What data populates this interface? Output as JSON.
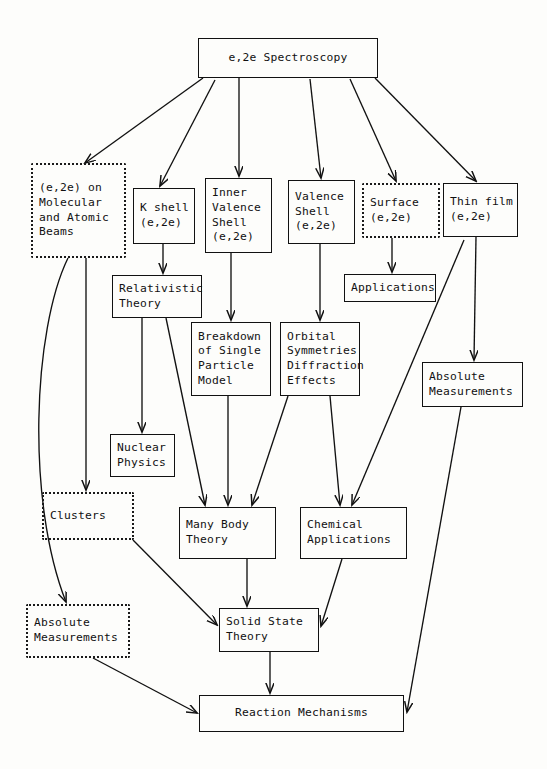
{
  "diagram": {
    "title": "e,2e Spectroscopy",
    "type": "flowchart",
    "nodes": [
      {
        "id": "root",
        "label": "e,2e Spectroscopy",
        "lines": [
          "e,2e Spectroscopy"
        ],
        "style": "solid",
        "x": 198,
        "y": 38,
        "w": 180,
        "h": 40
      },
      {
        "id": "molecular",
        "label": "(e,2e) on Molecular and Atomic Beams",
        "lines": [
          "(e,2e) on",
          "Molecular",
          "and Atomic",
          "Beams"
        ],
        "style": "dashed",
        "x": 31,
        "y": 163,
        "w": 95,
        "h": 95
      },
      {
        "id": "kshell",
        "label": "K shell (e,2e)",
        "lines": [
          "K shell",
          "(e,2e)"
        ],
        "style": "solid",
        "x": 133,
        "y": 188,
        "w": 62,
        "h": 56
      },
      {
        "id": "innervalence",
        "label": "Inner Valence Shell (e,2e)",
        "lines": [
          "Inner",
          "Valence",
          "Shell",
          "(e,2e)"
        ],
        "style": "solid",
        "x": 205,
        "y": 178,
        "w": 67,
        "h": 75
      },
      {
        "id": "valence",
        "label": "Valence Shell (e,2e)",
        "lines": [
          "Valence",
          "Shell",
          "(e,2e)"
        ],
        "style": "solid",
        "x": 288,
        "y": 180,
        "w": 67,
        "h": 64
      },
      {
        "id": "surface",
        "label": "Surface (e,2e)",
        "lines": [
          "Surface",
          "(e,2e)"
        ],
        "style": "dashed",
        "x": 362,
        "y": 183,
        "w": 78,
        "h": 55
      },
      {
        "id": "thinfilm",
        "label": "Thin film (e,2e)",
        "lines": [
          "Thin film",
          "(e,2e)"
        ],
        "style": "solid",
        "x": 443,
        "y": 183,
        "w": 75,
        "h": 54
      },
      {
        "id": "relativistic",
        "label": "Relativistic Theory",
        "lines": [
          "Relativistic",
          "Theory"
        ],
        "style": "solid",
        "x": 112,
        "y": 275,
        "w": 90,
        "h": 43
      },
      {
        "id": "breakdown",
        "label": "Breakdown of Single Particle Model",
        "lines": [
          "Breakdown",
          "of Single",
          "Particle",
          "Model"
        ],
        "style": "solid",
        "x": 191,
        "y": 322,
        "w": 80,
        "h": 74
      },
      {
        "id": "orbital",
        "label": "Orbital Symmetries Diffraction Effects",
        "lines": [
          "Orbital",
          "Symmetries",
          "Diffraction",
          "Effects"
        ],
        "style": "solid",
        "x": 280,
        "y": 322,
        "w": 80,
        "h": 74
      },
      {
        "id": "applications",
        "label": "Applications",
        "lines": [
          "Applications"
        ],
        "style": "solid",
        "x": 344,
        "y": 274,
        "w": 92,
        "h": 28
      },
      {
        "id": "absmeas_r",
        "label": "Absolute Measurements",
        "lines": [
          "Absolute",
          "Measurements"
        ],
        "style": "solid",
        "x": 422,
        "y": 362,
        "w": 101,
        "h": 45
      },
      {
        "id": "nuclear",
        "label": "Nuclear Physics",
        "lines": [
          "Nuclear",
          "Physics"
        ],
        "style": "solid",
        "x": 110,
        "y": 434,
        "w": 65,
        "h": 43
      },
      {
        "id": "clusters",
        "label": "Clusters",
        "lines": [
          "Clusters"
        ],
        "style": "dashed",
        "x": 42,
        "y": 492,
        "w": 92,
        "h": 48
      },
      {
        "id": "manybody",
        "label": "Many Body Theory",
        "lines": [
          "Many Body",
          "Theory"
        ],
        "style": "solid",
        "x": 179,
        "y": 507,
        "w": 97,
        "h": 52
      },
      {
        "id": "chemical",
        "label": "Chemical Applications",
        "lines": [
          "Chemical",
          "Applications"
        ],
        "style": "solid",
        "x": 300,
        "y": 507,
        "w": 107,
        "h": 52
      },
      {
        "id": "absmeas_l",
        "label": "Absolute Measurements",
        "lines": [
          "Absolute",
          "Measurements"
        ],
        "style": "dashed",
        "x": 26,
        "y": 604,
        "w": 104,
        "h": 54
      },
      {
        "id": "solidstate",
        "label": "Solid State Theory",
        "lines": [
          "Solid State",
          "Theory"
        ],
        "style": "solid",
        "x": 219,
        "y": 608,
        "w": 100,
        "h": 44
      },
      {
        "id": "reaction",
        "label": "Reaction Mechanisms",
        "lines": [
          "Reaction Mechanisms"
        ],
        "style": "solid",
        "x": 199,
        "y": 695,
        "w": 205,
        "h": 37
      }
    ],
    "edges": [
      {
        "from": "root",
        "to": "molecular"
      },
      {
        "from": "root",
        "to": "kshell"
      },
      {
        "from": "root",
        "to": "innervalence"
      },
      {
        "from": "root",
        "to": "valence"
      },
      {
        "from": "root",
        "to": "surface"
      },
      {
        "from": "root",
        "to": "thinfilm"
      },
      {
        "from": "molecular",
        "to": "clusters"
      },
      {
        "from": "molecular",
        "to": "absmeas_l"
      },
      {
        "from": "kshell",
        "to": "relativistic"
      },
      {
        "from": "innervalence",
        "to": "breakdown"
      },
      {
        "from": "valence",
        "to": "orbital"
      },
      {
        "from": "surface",
        "to": "applications"
      },
      {
        "from": "thinfilm",
        "to": "absmeas_r"
      },
      {
        "from": "thinfilm",
        "to": "chemical"
      },
      {
        "from": "relativistic",
        "to": "nuclear"
      },
      {
        "from": "relativistic",
        "to": "manybody"
      },
      {
        "from": "breakdown",
        "to": "manybody"
      },
      {
        "from": "orbital",
        "to": "manybody"
      },
      {
        "from": "orbital",
        "to": "chemical"
      },
      {
        "from": "clusters",
        "to": "solidstate"
      },
      {
        "from": "manybody",
        "to": "solidstate"
      },
      {
        "from": "chemical",
        "to": "solidstate"
      },
      {
        "from": "absmeas_l",
        "to": "reaction"
      },
      {
        "from": "absmeas_r",
        "to": "reaction"
      },
      {
        "from": "solidstate",
        "to": "reaction"
      }
    ]
  }
}
